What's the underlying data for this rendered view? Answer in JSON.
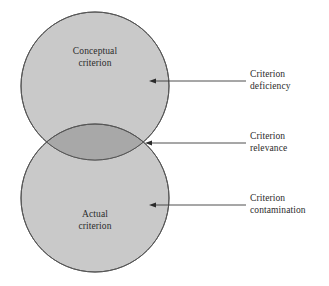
{
  "diagram": {
    "type": "venn",
    "title_visible": false,
    "background_color": "#ffffff",
    "circles": [
      {
        "id": "conceptual",
        "label": "Conceptual\ncriterion",
        "label_line_1": "Conceptual",
        "label_line_2": "criterion",
        "center_x": 95,
        "center_y": 86,
        "radius": 74,
        "fill_color": "#c9c9c9",
        "stroke_color": "#555555"
      },
      {
        "id": "actual",
        "label": "Actual\ncriterion",
        "label_line_1": "Actual",
        "label_line_2": "criterion",
        "center_x": 95,
        "center_y": 198,
        "radius": 74,
        "fill_color": "#c9c9c9",
        "stroke_color": "#555555"
      }
    ],
    "overlap": {
      "id": "intersection",
      "fill_color": "#a8a8a8",
      "stroke_color": "#555555",
      "intersection_left_x": 22,
      "intersection_right_x": 168,
      "intersection_y": 144
    },
    "annotations": [
      {
        "id": "deficiency",
        "label": "Criterion\ndeficiency",
        "label_line_1": "Criterion",
        "label_line_2": "deficiency",
        "arrow_tip_x": 149,
        "arrow_tip_y": 81,
        "arrow_tail_x": 246,
        "arrow_tail_y": 81,
        "target_region": "conceptual-only"
      },
      {
        "id": "relevance",
        "label": "Criterion\nrelevance",
        "label_line_1": "Criterion",
        "label_line_2": "relevance",
        "arrow_tip_x": 145,
        "arrow_tip_y": 143,
        "arrow_tail_x": 246,
        "arrow_tail_y": 143,
        "target_region": "overlap"
      },
      {
        "id": "contamination",
        "label": "Criterion\ncontamination",
        "label_line_1": "Criterion",
        "label_line_2": "contamination",
        "arrow_tip_x": 149,
        "arrow_tip_y": 205,
        "arrow_tail_x": 246,
        "arrow_tail_y": 205,
        "target_region": "actual-only"
      }
    ],
    "colors": {
      "circle_fill": "#c9c9c9",
      "overlap_fill": "#a8a8a8",
      "outline": "#555555",
      "text": "#2b2b2b",
      "arrow": "#3a3a3a"
    }
  }
}
